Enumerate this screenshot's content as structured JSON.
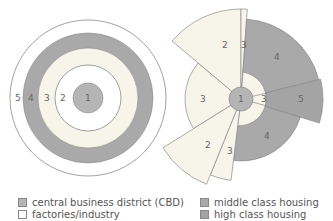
{
  "colors": {
    "cbd": "#b5b5b5",
    "industry": "#ffffff",
    "low": "#f7f4ea",
    "middle": "#a9a9a9",
    "high": "#a4a4a4",
    "stroke": "#8a8a8a"
  },
  "concentric_model": {
    "labels": [
      "5",
      "4",
      "3",
      "2",
      "1"
    ]
  },
  "sector_model": {
    "labels": {
      "center": "1",
      "top_left_2": "2",
      "top_strip_3": "3",
      "top_right_4": "4",
      "right_inner_3": "3",
      "right_5": "5",
      "left_3": "3",
      "bottom_right_4": "4",
      "bottom_left_2": "2",
      "bottom_3": "3"
    }
  },
  "legend": {
    "items": [
      {
        "label": "central business district (CBD)",
        "color": "#b5b5b5"
      },
      {
        "label": "factories/industry",
        "color": "#ffffff"
      },
      {
        "label": "middle class housing",
        "color": "#a9a9a9"
      },
      {
        "label": "high class housing",
        "color": "#a4a4a4"
      }
    ]
  }
}
